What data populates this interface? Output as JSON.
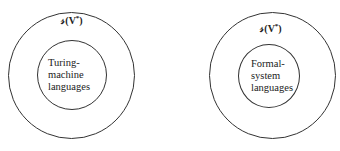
{
  "diagrams": [
    {
      "outer_label_prefix": "𝓈(V",
      "outer_label_sup": "*",
      "outer_label_suffix": ")",
      "inner_lines": [
        "Turing-",
        "machine",
        "languages"
      ]
    },
    {
      "outer_label_prefix": "𝓈(V",
      "outer_label_sup": "*",
      "outer_label_suffix": ")",
      "inner_lines": [
        "Formal-",
        "system",
        "languages"
      ]
    }
  ]
}
